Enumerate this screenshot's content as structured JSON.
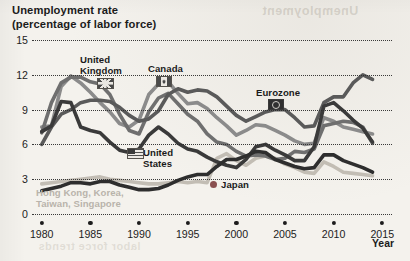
{
  "figure": {
    "title_line1": "Unemployment rate",
    "title_line2": "(percentage of labor force)",
    "x_axis_title": "Year",
    "bleed_top": "Unemployment",
    "bleed_bottom": "labor force trends"
  },
  "chart_data": {
    "type": "line",
    "title": "Unemployment rate (percentage of labor force)",
    "xlabel": "Year",
    "ylabel": "Unemployment rate (percentage of labor force)",
    "xlim": [
      1979,
      2016
    ],
    "ylim": [
      0,
      15
    ],
    "yticks": [
      0,
      3,
      6,
      9,
      12,
      15
    ],
    "xticks": [
      1980,
      1985,
      1990,
      1995,
      2000,
      2005,
      2010,
      2015
    ],
    "grid": "horizontal-dotted",
    "legend": "inline-labels",
    "x": [
      1980,
      1981,
      1982,
      1983,
      1984,
      1985,
      1986,
      1987,
      1988,
      1989,
      1990,
      1991,
      1992,
      1993,
      1994,
      1995,
      1996,
      1997,
      1998,
      1999,
      2000,
      2001,
      2002,
      2003,
      2004,
      2005,
      2006,
      2007,
      2008,
      2009,
      2010,
      2011,
      2012,
      2013,
      2014
    ],
    "series": [
      {
        "name": "United Kingdom",
        "color": "#6f6f6f",
        "values": [
          7.0,
          9.6,
          11.3,
          11.8,
          11.8,
          11.4,
          11.2,
          10.3,
          8.6,
          7.2,
          6.9,
          8.8,
          10.0,
          10.4,
          9.5,
          8.6,
          8.0,
          6.9,
          6.2,
          6.0,
          5.4,
          5.0,
          5.1,
          5.0,
          4.7,
          4.8,
          5.4,
          5.3,
          5.6,
          7.6,
          7.8,
          8.0,
          7.9,
          7.5,
          6.1
        ]
      },
      {
        "name": "Canada",
        "color": "#8b8b8b",
        "values": [
          7.5,
          7.6,
          11.0,
          11.9,
          11.3,
          10.5,
          9.6,
          8.8,
          7.8,
          7.5,
          8.1,
          10.3,
          11.2,
          11.4,
          10.4,
          9.5,
          9.6,
          9.1,
          8.3,
          7.6,
          6.8,
          7.2,
          7.7,
          7.6,
          7.2,
          6.8,
          6.3,
          6.0,
          6.1,
          8.3,
          8.0,
          7.5,
          7.3,
          7.1,
          6.9
        ]
      },
      {
        "name": "Eurozone",
        "color": "#5a5a5a",
        "values": [
          6.0,
          7.5,
          8.6,
          9.0,
          9.6,
          9.8,
          9.8,
          9.7,
          9.2,
          8.5,
          8.0,
          8.2,
          8.9,
          10.3,
          10.8,
          10.5,
          10.7,
          10.6,
          10.1,
          9.3,
          8.5,
          8.0,
          8.4,
          8.8,
          9.0,
          9.0,
          8.3,
          7.5,
          7.6,
          9.6,
          10.1,
          10.1,
          11.3,
          12.0,
          11.6
        ]
      },
      {
        "name": "United States",
        "color": "#3a3a3a",
        "values": [
          7.1,
          7.6,
          9.7,
          9.6,
          7.5,
          7.2,
          7.0,
          6.2,
          5.5,
          5.3,
          5.6,
          6.8,
          7.5,
          6.9,
          6.1,
          5.6,
          5.4,
          4.9,
          4.5,
          4.2,
          4.0,
          4.7,
          5.8,
          6.0,
          5.5,
          5.1,
          4.6,
          4.6,
          5.8,
          9.3,
          9.6,
          8.9,
          8.1,
          7.4,
          6.2
        ]
      },
      {
        "name": "Japan",
        "color": "#2e2e2e",
        "values": [
          2.0,
          2.2,
          2.4,
          2.7,
          2.7,
          2.6,
          2.8,
          2.8,
          2.5,
          2.3,
          2.1,
          2.1,
          2.2,
          2.5,
          2.9,
          3.2,
          3.4,
          3.4,
          4.1,
          4.7,
          4.7,
          5.0,
          5.4,
          5.3,
          4.7,
          4.4,
          4.1,
          3.9,
          4.0,
          5.1,
          5.1,
          4.6,
          4.3,
          4.0,
          3.6
        ]
      },
      {
        "name": "Hong Kong, Korea, Taiwan, Singapore",
        "color": "#c2bdb4",
        "values": [
          2.6,
          2.7,
          2.8,
          2.9,
          3.0,
          3.1,
          3.2,
          3.0,
          2.9,
          2.8,
          2.7,
          2.6,
          2.6,
          2.7,
          2.8,
          2.7,
          2.8,
          2.7,
          4.8,
          5.2,
          4.6,
          4.2,
          4.8,
          5.0,
          4.8,
          4.3,
          4.0,
          3.6,
          3.5,
          4.5,
          4.1,
          3.6,
          3.5,
          3.4,
          3.3
        ]
      }
    ],
    "annotations": [
      {
        "text": "United Kingdom",
        "series": "United Kingdom",
        "icon": "flag-uk-icon"
      },
      {
        "text": "Canada",
        "series": "Canada",
        "icon": "flag-canada-icon"
      },
      {
        "text": "Eurozone",
        "series": "Eurozone",
        "icon": "flag-eu-icon"
      },
      {
        "text": "United States",
        "series": "United States",
        "icon": "flag-us-icon"
      },
      {
        "text": "Japan",
        "series": "Japan",
        "icon": "flag-japan-icon"
      },
      {
        "text": "Hong Kong, Korea,\nTaiwan, Singapore",
        "series": "Hong Kong, Korea, Taiwan, Singapore",
        "icon": "none"
      }
    ]
  },
  "labels": {
    "uk_l1": "United",
    "uk_l2": "Kingdom",
    "canada": "Canada",
    "eurozone": "Eurozone",
    "us_l1": "United",
    "us_l2": "States",
    "japan": "Japan",
    "tigers_l1": "Hong Kong, Korea,",
    "tigers_l2": "Taiwan, Singapore"
  },
  "axis": {
    "y": [
      "15",
      "12",
      "9",
      "6",
      "3",
      "0"
    ],
    "x": [
      "1980",
      "1985",
      "1990",
      "1995",
      "2000",
      "2005",
      "2010",
      "2015"
    ]
  }
}
